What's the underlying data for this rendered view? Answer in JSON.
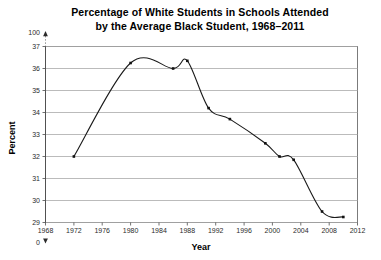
{
  "chart_data": {
    "type": "line",
    "title": "Percentage of White Students in Schools Attended by the Average Black Student, 1968–2011",
    "title_lines": [
      "Percentage of White Students in Schools Attended",
      "by the Average Black Student, 1968–2011"
    ],
    "xlabel": "Year",
    "ylabel": "Percent",
    "xlim": [
      1968,
      2012
    ],
    "ylim": [
      29,
      37
    ],
    "y_axis_break": true,
    "y_axis_break_top_label": "100",
    "y_axis_zero_label": "0",
    "grid": true,
    "legend": false,
    "x_ticks": [
      "1968",
      "1972",
      "1976",
      "1980",
      "1984",
      "1988",
      "1992",
      "1996",
      "2000",
      "2004",
      "2008",
      "2012"
    ],
    "y_ticks": [
      "29",
      "30",
      "31",
      "32",
      "33",
      "34",
      "35",
      "36",
      "37"
    ],
    "line_color": "#1a1a1a",
    "grid_color": "#a9a9a9",
    "x": [
      1972,
      1980,
      1986,
      1988,
      1991,
      1994,
      1999,
      2001,
      2003,
      2007,
      2010
    ],
    "values": [
      32.0,
      36.25,
      36.0,
      36.35,
      34.2,
      33.7,
      32.6,
      32.0,
      31.85,
      29.5,
      29.25
    ],
    "points": [
      {
        "year": 1972,
        "percent": 32.0
      },
      {
        "year": 1980,
        "percent": 36.25
      },
      {
        "year": 1986,
        "percent": 36.0
      },
      {
        "year": 1988,
        "percent": 36.35
      },
      {
        "year": 1991,
        "percent": 34.2
      },
      {
        "year": 1994,
        "percent": 33.7
      },
      {
        "year": 1999,
        "percent": 32.6
      },
      {
        "year": 2001,
        "percent": 32.0
      },
      {
        "year": 2003,
        "percent": 31.85
      },
      {
        "year": 2007,
        "percent": 29.5
      },
      {
        "year": 2010,
        "percent": 29.25
      }
    ]
  }
}
